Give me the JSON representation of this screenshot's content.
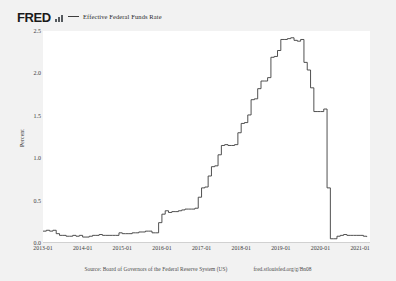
{
  "brand": {
    "logo_text": "FRED",
    "logo_icon": "bar-chart-icon"
  },
  "legend": {
    "items": [
      {
        "label": "Effective Federal Funds Rate",
        "color": "#3d3d3d"
      }
    ]
  },
  "footer": {
    "source": "Source: Board of Governors of the Federal Reserve System (US)",
    "url": "fred.stlouisfed.org/g/Bn08"
  },
  "colors": {
    "page_background": "#f2f2f2",
    "plot_background": "#ffffff",
    "line": "#3d3d3d",
    "axis": "#777777",
    "text": "#3a3a3a"
  },
  "chart_data": {
    "type": "line",
    "title": "",
    "subtitle": "",
    "xlabel": "",
    "ylabel": "Percent",
    "grid": false,
    "legend_position": "top",
    "ylim": [
      0.0,
      2.5
    ],
    "yticks": [
      0.0,
      0.5,
      1.0,
      1.5,
      2.0,
      2.5
    ],
    "ytick_labels": [
      "0.0",
      "0.5",
      "1.0",
      "1.5",
      "2.0",
      "2.5"
    ],
    "xlim": [
      "2013-01",
      "2021-04"
    ],
    "xticks": [
      "2013-01",
      "2014-01",
      "2015-01",
      "2016-01",
      "2017-01",
      "2018-01",
      "2019-01",
      "2020-01",
      "2021-01"
    ],
    "xtick_labels": [
      "2013-01",
      "2014-01",
      "2015-01",
      "2016-01",
      "2017-01",
      "2018-01",
      "2019-01",
      "2020-01",
      "2021-01"
    ],
    "series": [
      {
        "name": "Effective Federal Funds Rate",
        "color": "#3d3d3d",
        "x": [
          "2013-01",
          "2013-02",
          "2013-03",
          "2013-04",
          "2013-05",
          "2013-06",
          "2013-07",
          "2013-08",
          "2013-09",
          "2013-10",
          "2013-11",
          "2013-12",
          "2014-01",
          "2014-02",
          "2014-03",
          "2014-04",
          "2014-05",
          "2014-06",
          "2014-07",
          "2014-08",
          "2014-09",
          "2014-10",
          "2014-11",
          "2014-12",
          "2015-01",
          "2015-02",
          "2015-03",
          "2015-04",
          "2015-05",
          "2015-06",
          "2015-07",
          "2015-08",
          "2015-09",
          "2015-10",
          "2015-11",
          "2015-12",
          "2016-01",
          "2016-02",
          "2016-03",
          "2016-04",
          "2016-05",
          "2016-06",
          "2016-07",
          "2016-08",
          "2016-09",
          "2016-10",
          "2016-11",
          "2016-12",
          "2017-01",
          "2017-02",
          "2017-03",
          "2017-04",
          "2017-05",
          "2017-06",
          "2017-07",
          "2017-08",
          "2017-09",
          "2017-10",
          "2017-11",
          "2017-12",
          "2018-01",
          "2018-02",
          "2018-03",
          "2018-04",
          "2018-05",
          "2018-06",
          "2018-07",
          "2018-08",
          "2018-09",
          "2018-10",
          "2018-11",
          "2018-12",
          "2019-01",
          "2019-02",
          "2019-03",
          "2019-04",
          "2019-05",
          "2019-06",
          "2019-07",
          "2019-08",
          "2019-09",
          "2019-10",
          "2019-11",
          "2019-12",
          "2020-01",
          "2020-02",
          "2020-03",
          "2020-04",
          "2020-05",
          "2020-06",
          "2020-07",
          "2020-08",
          "2020-09",
          "2020-10",
          "2020-11",
          "2020-12",
          "2021-01",
          "2021-02",
          "2021-03"
        ],
        "values": [
          0.14,
          0.15,
          0.14,
          0.15,
          0.11,
          0.09,
          0.09,
          0.08,
          0.08,
          0.09,
          0.08,
          0.09,
          0.07,
          0.07,
          0.08,
          0.09,
          0.09,
          0.1,
          0.09,
          0.09,
          0.09,
          0.09,
          0.09,
          0.12,
          0.11,
          0.11,
          0.11,
          0.12,
          0.12,
          0.13,
          0.13,
          0.14,
          0.14,
          0.12,
          0.12,
          0.24,
          0.34,
          0.38,
          0.36,
          0.37,
          0.37,
          0.38,
          0.39,
          0.4,
          0.4,
          0.4,
          0.41,
          0.54,
          0.65,
          0.66,
          0.79,
          0.9,
          0.91,
          1.04,
          1.15,
          1.16,
          1.15,
          1.15,
          1.16,
          1.3,
          1.41,
          1.42,
          1.51,
          1.69,
          1.7,
          1.82,
          1.91,
          1.91,
          1.95,
          2.19,
          2.2,
          2.27,
          2.4,
          2.4,
          2.41,
          2.42,
          2.39,
          2.38,
          2.4,
          2.13,
          2.04,
          1.83,
          1.55,
          1.55,
          1.55,
          1.58,
          0.65,
          0.05,
          0.05,
          0.08,
          0.09,
          0.1,
          0.09,
          0.09,
          0.09,
          0.09,
          0.09,
          0.08,
          0.07
        ]
      }
    ]
  }
}
